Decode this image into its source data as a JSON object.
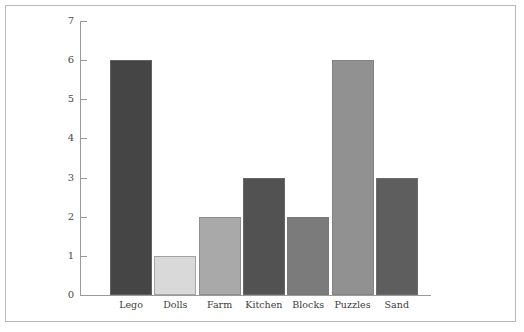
{
  "chart_data": {
    "type": "bar",
    "title": "",
    "subtitle": "",
    "xlabel": "",
    "ylabel": "",
    "categories": [
      "Lego",
      "Dolls",
      "Farm",
      "Kitchen",
      "Blocks",
      "Puzzles",
      "Sand"
    ],
    "values": [
      6,
      1,
      2,
      3,
      2,
      6,
      3
    ],
    "bar_colors": [
      "#454545",
      "#d9d9d9",
      "#a9a9a9",
      "#525252",
      "#7b7b7b",
      "#919191",
      "#5e5e5e"
    ],
    "ylim": [
      0,
      7
    ],
    "yticks": [
      0,
      1,
      2,
      3,
      4,
      5,
      6,
      7
    ],
    "ytick_labels": [
      "0",
      "1",
      "2",
      "3",
      "4",
      "5",
      "6",
      "7"
    ],
    "grid": false,
    "legend": null,
    "legend_position": "none",
    "annotations": []
  },
  "axes": {
    "axis_color": "#9a9a9a",
    "tick_label_color": "#4a4a4a",
    "category_label_color": "#3c3c3c"
  },
  "frame": {
    "border_color": "#b9b9b9",
    "background": "#ffffff"
  }
}
